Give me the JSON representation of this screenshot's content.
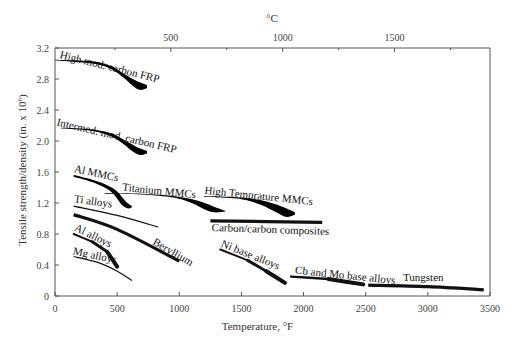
{
  "chart_data": {
    "type": "line",
    "title": "",
    "xlabel": "Temperature, °F",
    "ylabel": "Tensile strength/density (in. x 10^6)",
    "ylabel_parts": [
      "Tensile strength/density (in. x 10",
      "6",
      ")"
    ],
    "secondary_xlabel": "°C",
    "xlim": [
      0,
      3500
    ],
    "ylim": [
      0,
      3.2
    ],
    "x_ticks": [
      0,
      500,
      1000,
      1500,
      2000,
      2500,
      3000,
      3500
    ],
    "x_tick_labels": [
      "0",
      "500",
      "1000",
      "1500",
      "2000",
      "2500",
      "3000",
      "3500"
    ],
    "y_ticks": [
      0,
      0.4,
      0.8,
      1.2,
      1.6,
      2.0,
      2.4,
      2.8,
      3.2
    ],
    "y_tick_labels": [
      "0",
      "0.4",
      "0.8",
      "1.2",
      "1.6",
      "2.0",
      "2.4",
      "2.8",
      "3.2"
    ],
    "secondary_x_ticks_c": [
      500,
      1000,
      1500
    ],
    "secondary_x_tick_labels": [
      "500",
      "1000",
      "1500"
    ],
    "grid": false,
    "legend": "inline labels",
    "series": [
      {
        "name": "High mod. carbon FRP",
        "style": "band",
        "upper": [
          [
            0,
            3.05
          ],
          [
            300,
            3.03
          ],
          [
            450,
            2.97
          ],
          [
            550,
            2.87
          ],
          [
            650,
            2.78
          ],
          [
            740,
            2.72
          ]
        ],
        "lower": [
          [
            0,
            3.04
          ],
          [
            300,
            3.0
          ],
          [
            450,
            2.93
          ],
          [
            550,
            2.82
          ],
          [
            620,
            2.72
          ],
          [
            680,
            2.66
          ],
          [
            740,
            2.68
          ]
        ]
      },
      {
        "name": "Intermed. mod. carbon FRP",
        "style": "band",
        "upper": [
          [
            50,
            2.17
          ],
          [
            300,
            2.15
          ],
          [
            450,
            2.1
          ],
          [
            550,
            2.02
          ],
          [
            650,
            1.93
          ],
          [
            740,
            1.87
          ]
        ],
        "lower": [
          [
            50,
            2.16
          ],
          [
            300,
            2.13
          ],
          [
            450,
            2.06
          ],
          [
            550,
            1.96
          ],
          [
            620,
            1.87
          ],
          [
            680,
            1.82
          ],
          [
            740,
            1.84
          ]
        ]
      },
      {
        "name": "Al MMCs",
        "style": "band",
        "upper": [
          [
            150,
            1.56
          ],
          [
            300,
            1.5
          ],
          [
            420,
            1.43
          ],
          [
            500,
            1.35
          ],
          [
            570,
            1.22
          ],
          [
            620,
            1.16
          ]
        ],
        "lower": [
          [
            150,
            1.54
          ],
          [
            300,
            1.47
          ],
          [
            420,
            1.38
          ],
          [
            480,
            1.3
          ],
          [
            540,
            1.17
          ],
          [
            590,
            1.13
          ],
          [
            620,
            1.15
          ]
        ]
      },
      {
        "name": "Titanium MMCs",
        "style": "band",
        "upper": [
          [
            400,
            1.33
          ],
          [
            700,
            1.32
          ],
          [
            950,
            1.29
          ],
          [
            1150,
            1.23
          ],
          [
            1300,
            1.14
          ],
          [
            1370,
            1.1
          ]
        ],
        "lower": [
          [
            400,
            1.32
          ],
          [
            700,
            1.31
          ],
          [
            950,
            1.27
          ],
          [
            1100,
            1.2
          ],
          [
            1200,
            1.12
          ],
          [
            1280,
            1.08
          ],
          [
            1370,
            1.09
          ]
        ]
      },
      {
        "name": "High Temprature MMCs",
        "style": "band",
        "upper": [
          [
            1200,
            1.29
          ],
          [
            1500,
            1.27
          ],
          [
            1700,
            1.22
          ],
          [
            1850,
            1.14
          ],
          [
            1930,
            1.08
          ]
        ],
        "lower": [
          [
            1200,
            1.28
          ],
          [
            1500,
            1.25
          ],
          [
            1650,
            1.18
          ],
          [
            1780,
            1.08
          ],
          [
            1860,
            1.02
          ],
          [
            1930,
            1.05
          ]
        ]
      },
      {
        "name": "Carbon/carbon composites",
        "style": "thick",
        "points": [
          [
            1250,
            0.97
          ],
          [
            2150,
            0.95
          ]
        ]
      },
      {
        "name": "Ti alloys",
        "style": "thin",
        "points": [
          [
            150,
            1.16
          ],
          [
            500,
            1.04
          ],
          [
            830,
            0.89
          ]
        ]
      },
      {
        "name": "Beryllium",
        "style": "thick",
        "points": [
          [
            150,
            1.05
          ],
          [
            500,
            0.86
          ],
          [
            1000,
            0.45
          ]
        ]
      },
      {
        "name": "Al alloys",
        "style": "taper",
        "points": [
          [
            150,
            0.8
          ],
          [
            300,
            0.7
          ],
          [
            420,
            0.57
          ],
          [
            500,
            0.38
          ]
        ]
      },
      {
        "name": "Mg alloys",
        "style": "thin",
        "points": [
          [
            150,
            0.51
          ],
          [
            350,
            0.43
          ],
          [
            500,
            0.32
          ],
          [
            620,
            0.2
          ]
        ]
      },
      {
        "name": "Ni base alloys",
        "style": "taper",
        "points": [
          [
            1330,
            0.6
          ],
          [
            1550,
            0.46
          ],
          [
            1700,
            0.32
          ],
          [
            1850,
            0.17
          ]
        ]
      },
      {
        "name": "Cb and Mo base alloys",
        "style": "taper",
        "points": [
          [
            1900,
            0.25
          ],
          [
            2200,
            0.22
          ],
          [
            2480,
            0.15
          ]
        ]
      },
      {
        "name": "Tungsten",
        "style": "thick",
        "points": [
          [
            2520,
            0.14
          ],
          [
            3000,
            0.12
          ],
          [
            3450,
            0.08
          ]
        ]
      }
    ],
    "labels": [
      {
        "text": "High mod. carbon FRP",
        "x": 35,
        "y": 3.07,
        "rotate": 14
      },
      {
        "text": "Intermed. mod. carbon FRP",
        "x": 10,
        "y": 2.2,
        "rotate": 13
      },
      {
        "text": "Al MMCs",
        "x": 150,
        "y": 1.6,
        "rotate": 12
      },
      {
        "text": "Titanium MMCs",
        "x": 540,
        "y": 1.36,
        "rotate": 6
      },
      {
        "text": "High Temprature MMCs",
        "x": 1200,
        "y": 1.32,
        "rotate": 6
      },
      {
        "text": "Carbon/carbon composites",
        "x": 1260,
        "y": 0.84,
        "rotate": 2
      },
      {
        "text": "Ti alloys",
        "x": 150,
        "y": 1.21,
        "rotate": 8
      },
      {
        "text": "Beryllium",
        "x": 780,
        "y": 0.67,
        "rotate": 30
      },
      {
        "text": "Al alloys",
        "x": 150,
        "y": 0.85,
        "rotate": 26
      },
      {
        "text": "Mg alloys",
        "x": 140,
        "y": 0.54,
        "rotate": 12
      },
      {
        "text": "Ni base alloys",
        "x": 1330,
        "y": 0.64,
        "rotate": 22
      },
      {
        "text": "Cb and Mo base alloys",
        "x": 1930,
        "y": 0.29,
        "rotate": 6
      },
      {
        "text": "Tungsten",
        "x": 2800,
        "y": 0.2,
        "rotate": 0
      }
    ]
  }
}
